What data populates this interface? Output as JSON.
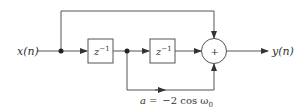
{
  "diagram": {
    "input_label": "x(n)",
    "output_label": "y(n)",
    "delay1_label": "z",
    "delay1_exp": "−1",
    "delay2_label": "z",
    "delay2_exp": "−1",
    "adder_symbol": "+",
    "coefficient": {
      "lhs": "a",
      "eq": "=",
      "rhs": "−2 cos ω",
      "sub": "0"
    },
    "line_color": "#555555"
  }
}
